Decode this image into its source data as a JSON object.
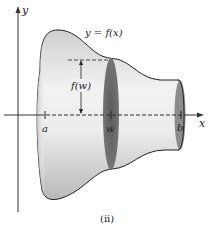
{
  "figure": {
    "caption": "(ii)",
    "curve_label": "y = f(x)",
    "radius_label": "f(w)",
    "axis_x_label": "x",
    "axis_y_label": "y",
    "tick_labels": {
      "a": "a",
      "w": "w",
      "b": "b"
    },
    "colors": {
      "solid_fill_light": "#f4f4f4",
      "solid_fill_dark": "#bdbdbd",
      "cross_section": "#6a6a6a",
      "end_cap": "#8a8a8a",
      "outline": "#222222"
    }
  }
}
